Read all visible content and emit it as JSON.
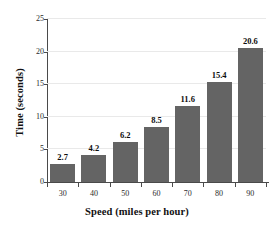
{
  "chart_data": {
    "type": "bar",
    "title": "",
    "xlabel": "Speed (miles per hour)",
    "ylabel": "Time (seconds)",
    "categories": [
      "30",
      "40",
      "50",
      "60",
      "70",
      "80",
      "90"
    ],
    "values": [
      2.7,
      4.2,
      6.2,
      8.5,
      11.6,
      15.4,
      20.6
    ],
    "value_labels": [
      "2.7",
      "4.2",
      "6.2",
      "8.5",
      "11.6",
      "15.4",
      "20.6"
    ],
    "ylim": [
      0,
      25
    ],
    "yticks": [
      0,
      5,
      10,
      15,
      20,
      25
    ],
    "ytick_labels": [
      "0",
      "5",
      "10",
      "15",
      "20",
      "25"
    ],
    "xtick_labels": [
      "30",
      "40",
      "50",
      "60",
      "70",
      "80",
      "90"
    ],
    "grid": true,
    "legend": false,
    "legend_position": "none",
    "bar_color": "#646464",
    "gridline_color": "#e9e9e9",
    "axis_color": "#4a4a4a",
    "background_color": "#ffffff"
  }
}
